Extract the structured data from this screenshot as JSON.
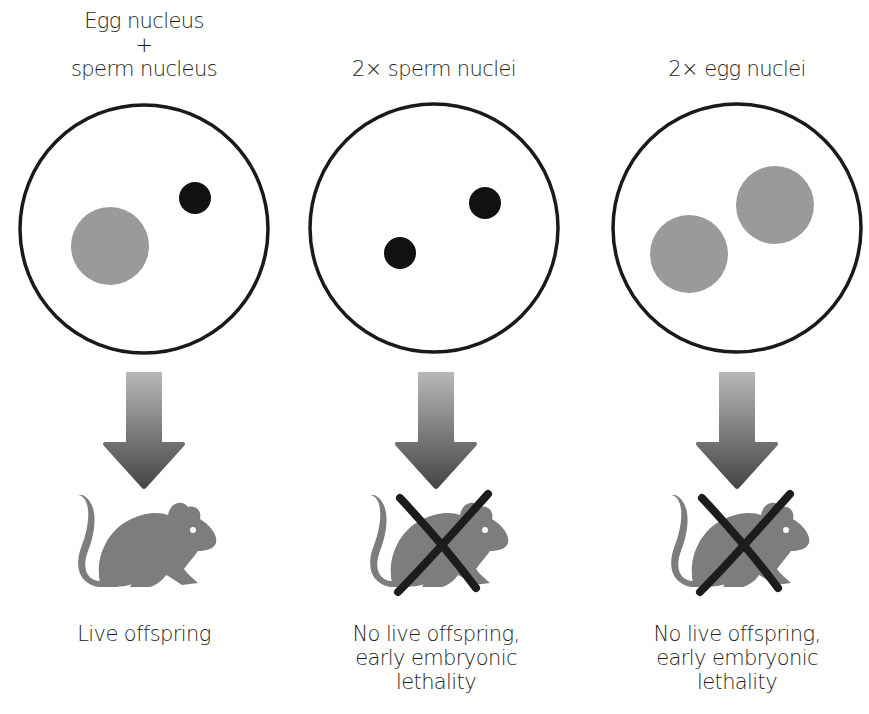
{
  "figure": {
    "columns": [
      {
        "id": "normal",
        "header_lines": [
          "Egg nucleus",
          "+",
          "sperm nucleus"
        ],
        "nuclei": [
          {
            "type": "egg",
            "cx": 110,
            "cy": 246,
            "r": 39
          },
          {
            "type": "sperm",
            "cx": 195,
            "cy": 198,
            "r": 16
          }
        ],
        "cell": {
          "cx": 144,
          "cy": 229,
          "r": 124
        },
        "arrow_x": 144,
        "crossed_out": false,
        "outcome_lines": [
          "Live offspring"
        ]
      },
      {
        "id": "androgenetic",
        "header_lines": [
          "2× sperm nuclei"
        ],
        "nuclei": [
          {
            "type": "sperm",
            "cx": 400,
            "cy": 253,
            "r": 16
          },
          {
            "type": "sperm",
            "cx": 485,
            "cy": 203,
            "r": 16
          }
        ],
        "cell": {
          "cx": 434,
          "cy": 228,
          "r": 124
        },
        "arrow_x": 436,
        "crossed_out": true,
        "outcome_lines": [
          "No live offspring,",
          "early embryonic",
          "lethality"
        ]
      },
      {
        "id": "gynogenetic",
        "header_lines": [
          "2× egg nuclei"
        ],
        "nuclei": [
          {
            "type": "egg",
            "cx": 689,
            "cy": 254,
            "r": 39
          },
          {
            "type": "egg",
            "cx": 775,
            "cy": 205,
            "r": 39
          }
        ],
        "cell": {
          "cx": 737,
          "cy": 228,
          "r": 124
        },
        "arrow_x": 737,
        "crossed_out": true,
        "outcome_lines": [
          "No live offspring,",
          "early embryonic",
          "lethality"
        ]
      }
    ],
    "colors": {
      "egg_nucleus": "#9a9a9a",
      "sperm_nucleus": "#111111",
      "cell_outline": "#1a1a1a",
      "mouse": "#7d7d7d",
      "cross": "#1c1c1c",
      "arrow_top": "#b5b5b5",
      "arrow_bottom": "#4a4a4a"
    },
    "icons": {
      "arrow": "down-arrow-icon",
      "mouse": "mouse-icon",
      "cross": "cross-out-icon"
    }
  }
}
